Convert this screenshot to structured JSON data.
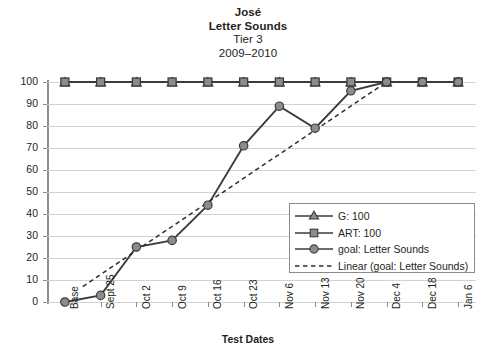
{
  "title": {
    "line1": "José",
    "line2": "Letter Sounds",
    "line3": "Tier 3",
    "line4": "2009–2010"
  },
  "axis": {
    "x_title": "Test Dates",
    "y_ticks": [
      "0",
      "10",
      "20",
      "30",
      "40",
      "50",
      "60",
      "70",
      "80",
      "90",
      "100"
    ]
  },
  "legend": {
    "items": [
      {
        "label": "G: 100",
        "marker": "triangle-marker-icon"
      },
      {
        "label": "ART: 100",
        "marker": "square-marker-icon"
      },
      {
        "label": "goal: Letter Sounds",
        "marker": "circle-marker-icon"
      },
      {
        "label": "Linear (goal: Letter Sounds)",
        "marker": "dashed-line-icon"
      }
    ]
  },
  "colors": {
    "series_line": "#3b3b3b",
    "marker_fill": "#8c8c8c",
    "gridline": "#d2d2d2",
    "axis": "#8d8d8d",
    "text": "#231f20",
    "legend_border": "#8b8b8b"
  },
  "chart_data": {
    "type": "line",
    "title": "José\nLetter Sounds\nTier 3\n2009–2010",
    "xlabel": "Test Dates",
    "ylabel": "",
    "ylim": [
      0,
      100
    ],
    "ytick_step": 10,
    "grid": true,
    "legend_position": "inside-bottom-right",
    "categories": [
      "Base",
      "Sept 25",
      "Oct 2",
      "Oct 9",
      "Oct 16",
      "Oct 23",
      "Nov 6",
      "Nov 13",
      "Nov 20",
      "Dec 4",
      "Dec 18",
      "Jan 6"
    ],
    "series": [
      {
        "name": "G: 100",
        "marker": "triangle",
        "values": [
          100,
          100,
          100,
          100,
          100,
          100,
          100,
          100,
          100,
          100,
          100,
          100
        ]
      },
      {
        "name": "ART: 100",
        "marker": "square",
        "values": [
          100,
          100,
          100,
          100,
          100,
          100,
          100,
          100,
          100,
          100,
          100,
          100
        ]
      },
      {
        "name": "goal: Letter Sounds",
        "marker": "circle",
        "values": [
          0,
          3,
          25,
          28,
          44,
          71,
          89,
          79,
          96,
          100,
          100,
          100
        ]
      },
      {
        "name": "Linear (goal: Letter Sounds)",
        "marker": "none",
        "style": "dashed",
        "trendline": true,
        "start": {
          "x_fraction": 0.5,
          "y": 7
        },
        "end": {
          "x_index": 9,
          "y": 100
        }
      }
    ]
  }
}
